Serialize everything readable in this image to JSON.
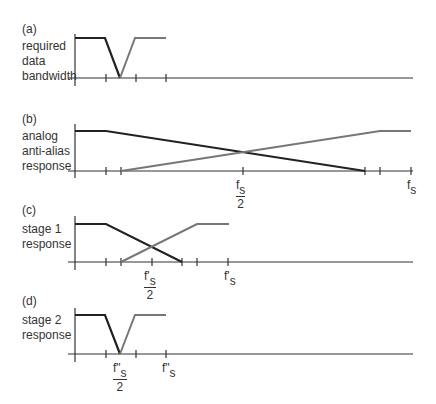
{
  "panels": [
    {
      "id": "a",
      "tag": "(a)",
      "label": "required\ndata\nbandwidth",
      "tick_labels": []
    },
    {
      "id": "b",
      "tag": "(b)",
      "label": "analog\nanti-alias\nresponse",
      "tick_labels": [
        {
          "num": "f",
          "sub": "s",
          "den": "2"
        },
        {
          "text": "f",
          "sub": "s"
        }
      ]
    },
    {
      "id": "c",
      "tag": "(c)",
      "label": "stage 1\nresponse",
      "tick_labels": [
        {
          "num": "f'",
          "sub": "s",
          "den": "2"
        },
        {
          "text": "f'",
          "sub": "s"
        }
      ]
    },
    {
      "id": "d",
      "tag": "(d)",
      "label": "stage 2\nresponse",
      "tick_labels": [
        {
          "num": "f\"",
          "sub": "s",
          "den": "2"
        },
        {
          "text": "f\"",
          "sub": "s"
        }
      ]
    }
  ],
  "colors": {
    "passband_response": "#222222",
    "image_response": "#777777",
    "axis": "#333333"
  }
}
